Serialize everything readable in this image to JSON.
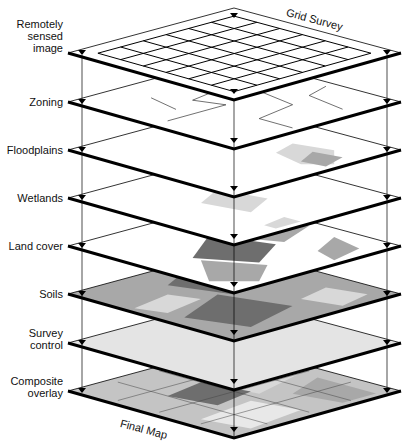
{
  "diagram": {
    "title_top": "Grid Survey",
    "title_bottom": "Final Map",
    "layers": [
      {
        "label": "Remotely\nsensed\nimage",
        "bottom_y": 100,
        "fill": "#ffffff",
        "pattern": "grid"
      },
      {
        "label": "Zoning",
        "bottom_y": 149,
        "fill": "#ffffff",
        "pattern": "lines"
      },
      {
        "label": "Floodplains",
        "bottom_y": 197,
        "fill": "#ffffff",
        "pattern": "flood"
      },
      {
        "label": "Wetlands",
        "bottom_y": 245,
        "fill": "#ffffff",
        "pattern": "wet"
      },
      {
        "label": "Land cover",
        "bottom_y": 293,
        "fill": "#ffffff",
        "pattern": "land"
      },
      {
        "label": "Soils",
        "bottom_y": 341,
        "fill": "#a8a8a8",
        "pattern": "soil"
      },
      {
        "label": "Survey\ncontrol",
        "bottom_y": 390,
        "fill": "#e4e4e4",
        "pattern": "none"
      },
      {
        "label": "Composite\noverlay",
        "bottom_y": 438,
        "fill": "#c4c4c4",
        "pattern": "composite"
      }
    ],
    "colors": {
      "light_gray": "#d8d8d8",
      "mid_gray": "#a8a8a8",
      "dark_gray": "#6e6e6e",
      "line": "#000000"
    }
  }
}
